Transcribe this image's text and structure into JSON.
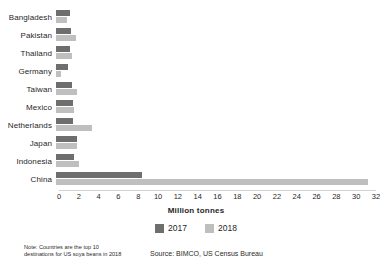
{
  "chart_data": {
    "type": "bar",
    "orientation": "horizontal",
    "title": "",
    "xlabel": "Million tonnes",
    "ylabel": "",
    "xlim": [
      0,
      32
    ],
    "xticks": [
      0,
      2,
      4,
      6,
      8,
      10,
      12,
      14,
      16,
      18,
      20,
      22,
      24,
      26,
      28,
      30,
      32
    ],
    "grid": false,
    "legend_position": "bottom-center",
    "categories": [
      "Bangladesh",
      "Pakistan",
      "Thailand",
      "Germany",
      "Taiwan",
      "Mexico",
      "Netherlands",
      "Japan",
      "Indonesia",
      "China"
    ],
    "series": [
      {
        "name": "2017",
        "color": "#6e6e6e",
        "values": [
          1.4,
          1.5,
          1.4,
          1.2,
          1.6,
          1.7,
          1.7,
          2.1,
          1.8,
          8.7
        ]
      },
      {
        "name": "2018",
        "color": "#bfbfbf",
        "values": [
          1.1,
          2.0,
          1.6,
          0.5,
          2.1,
          1.8,
          3.6,
          2.1,
          2.3,
          31.5
        ]
      }
    ],
    "note": "Note: Countries are the top 10 destinations for US soya beans in 2018",
    "source": "Source: BIMCO, US Census Bureau"
  },
  "footer": {
    "note_line_1": "Note: Countries are the top 10",
    "note_line_2": "destinations for US soya beans in 2018",
    "source": "Source: BIMCO, US Census Bureau"
  },
  "legend": {
    "items": [
      {
        "label": "2017"
      },
      {
        "label": "2018"
      }
    ]
  },
  "axis": {
    "xlabel": "Million tonnes"
  }
}
